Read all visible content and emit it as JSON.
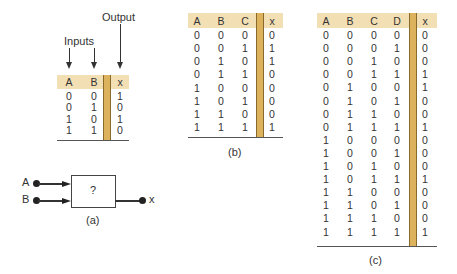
{
  "colors": {
    "header_bg": "#f3dfb4",
    "divider_bar": "#dcb35c",
    "text": "#333333"
  },
  "figure_a": {
    "output_label": "Output",
    "inputs_label": "Inputs",
    "table": {
      "headers": [
        "A",
        "B",
        "x"
      ],
      "rows": [
        [
          "0",
          "0",
          "1"
        ],
        [
          "0",
          "1",
          "0"
        ],
        [
          "1",
          "0",
          "1"
        ],
        [
          "1",
          "1",
          "0"
        ]
      ]
    },
    "gate": {
      "input_a_label": "A",
      "input_b_label": "B",
      "output_label": "x",
      "box_text": "?"
    },
    "caption": "(a)"
  },
  "figure_b": {
    "table": {
      "headers": [
        "A",
        "B",
        "C",
        "x"
      ],
      "rows": [
        [
          "0",
          "0",
          "0",
          "0"
        ],
        [
          "0",
          "0",
          "1",
          "1"
        ],
        [
          "0",
          "1",
          "0",
          "1"
        ],
        [
          "0",
          "1",
          "1",
          "0"
        ],
        [
          "1",
          "0",
          "0",
          "0"
        ],
        [
          "1",
          "0",
          "1",
          "0"
        ],
        [
          "1",
          "1",
          "0",
          "0"
        ],
        [
          "1",
          "1",
          "1",
          "1"
        ]
      ]
    },
    "caption": "(b)"
  },
  "figure_c": {
    "table": {
      "headers": [
        "A",
        "B",
        "C",
        "D",
        "x"
      ],
      "rows": [
        [
          "0",
          "0",
          "0",
          "0",
          "0"
        ],
        [
          "0",
          "0",
          "0",
          "1",
          "0"
        ],
        [
          "0",
          "0",
          "1",
          "0",
          "0"
        ],
        [
          "0",
          "0",
          "1",
          "1",
          "1"
        ],
        [
          "0",
          "1",
          "0",
          "0",
          "1"
        ],
        [
          "0",
          "1",
          "0",
          "1",
          "0"
        ],
        [
          "0",
          "1",
          "1",
          "0",
          "0"
        ],
        [
          "0",
          "1",
          "1",
          "1",
          "1"
        ],
        [
          "1",
          "0",
          "0",
          "0",
          "0"
        ],
        [
          "1",
          "0",
          "0",
          "1",
          "0"
        ],
        [
          "1",
          "0",
          "1",
          "0",
          "0"
        ],
        [
          "1",
          "0",
          "1",
          "1",
          "1"
        ],
        [
          "1",
          "1",
          "0",
          "0",
          "0"
        ],
        [
          "1",
          "1",
          "0",
          "1",
          "0"
        ],
        [
          "1",
          "1",
          "1",
          "0",
          "0"
        ],
        [
          "1",
          "1",
          "1",
          "1",
          "1"
        ]
      ]
    },
    "caption": "(c)"
  }
}
